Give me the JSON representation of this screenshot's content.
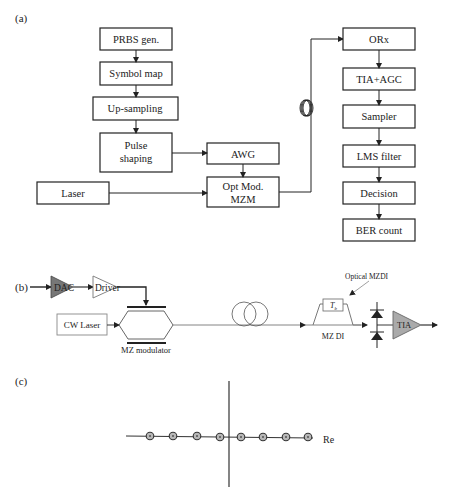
{
  "panel_a": {
    "label": "(a)",
    "transmitter_blocks": [
      "PRBS gen.",
      "Symbol map",
      "Up-sampling",
      "Pulse",
      "shaping"
    ],
    "awg": "AWG",
    "laser": "Laser",
    "modulator_line1": "Opt Mod.",
    "modulator_line2": "MZM",
    "receiver_blocks": [
      "ORx",
      "TIA+AGC",
      "Sampler",
      "LMS filter",
      "Decision",
      "BER count"
    ]
  },
  "panel_b": {
    "label": "(b)",
    "dac": "DAC",
    "driver": "Driver",
    "cw_laser": "CW Laser",
    "mz_modulator": "MZ modulator",
    "optical_mzdi": "Optical MZDI",
    "delay": "T",
    "delay_sub": "b",
    "mz_di": "MZ DI",
    "tia": "TIA"
  },
  "panel_c": {
    "label": "(c)",
    "axis_label": "Re",
    "constellation_points": 8
  },
  "colors": {
    "line": "#222222",
    "dac_fill": "#777777",
    "tia_fill": "#aaaaaa",
    "point_fill": "#b8b8b8"
  }
}
